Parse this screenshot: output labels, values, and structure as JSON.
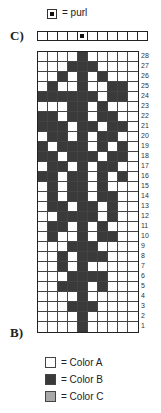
{
  "purl_key": {
    "label": "= purl"
  },
  "chart_c": {
    "label": "C)",
    "cells": [
      "A",
      "A",
      "A",
      "A",
      "P",
      "A",
      "A",
      "A",
      "A",
      "A",
      "A"
    ]
  },
  "chart_b": {
    "label": "B)",
    "columns": 10,
    "rows": [
      {
        "num": "28",
        "dark": [
          5
        ]
      },
      {
        "num": "27",
        "dark": [
          4,
          5,
          6
        ]
      },
      {
        "num": "26",
        "dark": [
          3,
          5,
          7
        ]
      },
      {
        "num": "25",
        "dark": [
          2,
          5,
          8,
          9
        ]
      },
      {
        "num": "24",
        "dark": [
          1,
          2,
          3,
          4,
          5,
          6,
          8,
          9
        ]
      },
      {
        "num": "23",
        "dark": [
          4,
          5,
          7
        ]
      },
      {
        "num": "22",
        "dark": [
          1,
          2,
          4,
          5,
          7,
          8
        ]
      },
      {
        "num": "21",
        "dark": [
          1,
          2,
          3,
          5,
          6,
          8,
          9
        ]
      },
      {
        "num": "20",
        "dark": [
          2,
          3,
          5,
          7,
          8
        ]
      },
      {
        "num": "19",
        "dark": [
          1,
          3,
          4,
          5,
          7,
          9
        ]
      },
      {
        "num": "18",
        "dark": [
          1,
          2,
          4,
          5,
          6,
          8,
          9
        ]
      },
      {
        "num": "17",
        "dark": [
          2,
          3,
          5,
          7,
          8
        ]
      },
      {
        "num": "16",
        "dark": [
          1,
          2,
          4,
          5,
          7,
          9
        ]
      },
      {
        "num": "15",
        "dark": [
          2,
          4,
          5,
          7
        ]
      },
      {
        "num": "14",
        "dark": [
          2,
          4,
          5,
          7,
          8
        ]
      },
      {
        "num": "13",
        "dark": [
          2,
          3,
          5,
          6,
          8
        ]
      },
      {
        "num": "12",
        "dark": [
          3,
          4,
          5,
          6,
          8
        ]
      },
      {
        "num": "11",
        "dark": [
          2,
          3,
          5,
          7
        ]
      },
      {
        "num": "10",
        "dark": [
          2,
          5,
          7,
          8
        ]
      },
      {
        "num": "9",
        "dark": [
          4,
          5,
          6
        ]
      },
      {
        "num": "8",
        "dark": [
          3,
          5,
          6,
          7
        ]
      },
      {
        "num": "7",
        "dark": [
          3,
          5
        ]
      },
      {
        "num": "6",
        "dark": [
          4,
          5,
          6,
          7
        ]
      },
      {
        "num": "5",
        "dark": [
          3,
          4,
          5,
          7
        ]
      },
      {
        "num": "4",
        "dark": [
          5
        ]
      },
      {
        "num": "3",
        "dark": [
          4,
          5,
          6
        ]
      },
      {
        "num": "2",
        "dark": [
          5
        ]
      },
      {
        "num": "1",
        "dark": [
          5
        ]
      }
    ]
  },
  "legend": [
    {
      "label": "= Color A",
      "color": "#ffffff"
    },
    {
      "label": "= Color B",
      "color": "#3a3a3a"
    },
    {
      "label": "= Color C",
      "color": "#a8a8a8"
    }
  ]
}
